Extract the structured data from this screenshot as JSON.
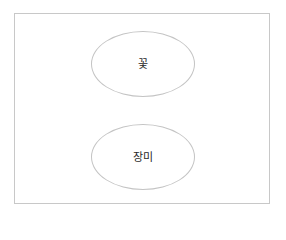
{
  "diagram": {
    "type": "concept-nodes",
    "nodes": [
      {
        "id": "top",
        "label": "꽃",
        "shape": "ellipse"
      },
      {
        "id": "bottom",
        "label": "장미",
        "shape": "ellipse"
      }
    ],
    "colors": {
      "border": "#c4c4c4",
      "frame_border": "#c8c8c8",
      "text": "#2a2a2a",
      "background": "#ffffff"
    }
  }
}
